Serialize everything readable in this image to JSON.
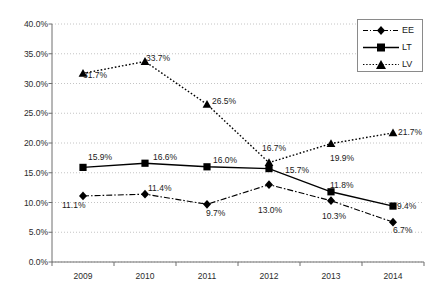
{
  "chart_data": {
    "type": "line",
    "title": "",
    "subtitle": "",
    "xlabel": "",
    "ylabel": "",
    "categories": [
      "2009",
      "2010",
      "2011",
      "2012",
      "2013",
      "2014"
    ],
    "ylim": [
      0,
      40
    ],
    "ytick_labels": [
      "0.0%",
      "5.0%",
      "10.0%",
      "15.0%",
      "20.0%",
      "25.0%",
      "30.0%",
      "35.0%",
      "40.0%"
    ],
    "ytick_values": [
      0,
      5,
      10,
      15,
      20,
      25,
      30,
      35,
      40
    ],
    "grid": "horizontal-dotted",
    "legend_position": "top-right",
    "series": [
      {
        "name": "EE",
        "marker": "diamond",
        "line_style": "dash-dot",
        "color": "#000000",
        "values": [
          11.1,
          11.4,
          9.7,
          13.0,
          10.3,
          6.7
        ],
        "labels": [
          "11.1%",
          "11.4%",
          "9.7%",
          "13.0%",
          "10.3%",
          "6.7%"
        ]
      },
      {
        "name": "LT",
        "marker": "square",
        "line_style": "solid",
        "color": "#000000",
        "values": [
          15.9,
          16.6,
          16.0,
          15.7,
          11.8,
          9.4
        ],
        "labels": [
          "15.9%",
          "16.6%",
          "16.0%",
          "15.7%",
          "11.8%",
          "9.4%"
        ]
      },
      {
        "name": "LV",
        "marker": "triangle",
        "line_style": "dotted",
        "color": "#000000",
        "values": [
          31.7,
          33.7,
          26.5,
          16.7,
          19.9,
          21.7
        ],
        "labels": [
          "31.7%",
          "33.7%",
          "26.5%",
          "16.7%",
          "19.9%",
          "21.7%"
        ]
      }
    ]
  },
  "legend": {
    "items": [
      {
        "label": "EE"
      },
      {
        "label": "LT"
      },
      {
        "label": "LV"
      }
    ]
  },
  "axis": {
    "y_labels": [
      "40.0%",
      "35.0%",
      "30.0%",
      "25.0%",
      "20.0%",
      "15.0%",
      "10.0%",
      "5.0%",
      "0.0%"
    ],
    "x_labels": [
      "2009",
      "2010",
      "2011",
      "2012",
      "2013",
      "2014"
    ]
  },
  "data_labels": {
    "ee": [
      {
        "text": "11.1%",
        "x": 62,
        "y": 200
      },
      {
        "text": "11.4%",
        "x": 148,
        "y": 183
      },
      {
        "text": "9.7%",
        "x": 206,
        "y": 208
      },
      {
        "text": "13.0%",
        "x": 258,
        "y": 205
      },
      {
        "text": "10.3%",
        "x": 322,
        "y": 211
      },
      {
        "text": "6.7%",
        "x": 393,
        "y": 225
      }
    ],
    "lt": [
      {
        "text": "15.9%",
        "x": 88,
        "y": 152
      },
      {
        "text": "16.6%",
        "x": 153,
        "y": 152
      },
      {
        "text": "16.0%",
        "x": 213,
        "y": 155
      },
      {
        "text": "15.7%",
        "x": 285,
        "y": 165
      },
      {
        "text": "11.8%",
        "x": 330,
        "y": 180
      },
      {
        "text": "9.4%",
        "x": 397,
        "y": 201
      }
    ],
    "lv": [
      {
        "text": "31.7%",
        "x": 83,
        "y": 70
      },
      {
        "text": "33.7%",
        "x": 146,
        "y": 53
      },
      {
        "text": "26.5%",
        "x": 212,
        "y": 96
      },
      {
        "text": "16.7%",
        "x": 262,
        "y": 143
      },
      {
        "text": "19.9%",
        "x": 330,
        "y": 153
      },
      {
        "text": "21.7%",
        "x": 398,
        "y": 127
      }
    ]
  }
}
